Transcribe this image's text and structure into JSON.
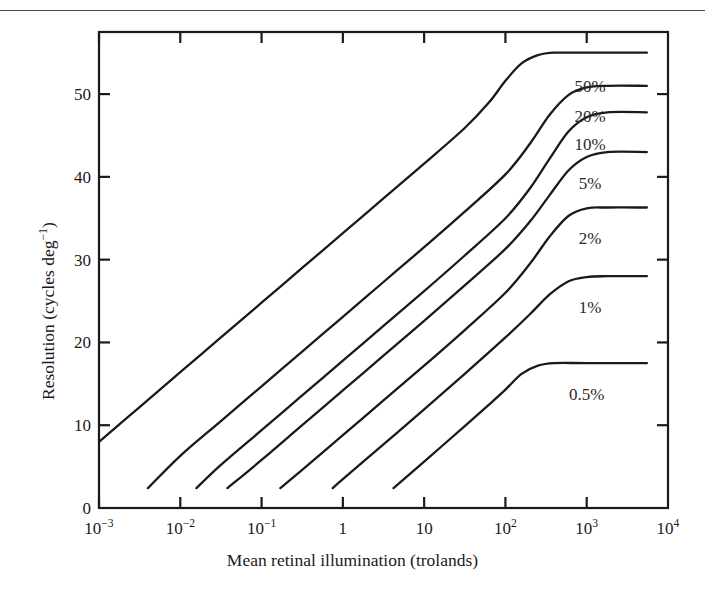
{
  "chart_data": {
    "type": "line",
    "title": "",
    "xlabel": "Mean retinal illumination (trolands)",
    "ylabel": "Resolution (cycles deg⁻¹)",
    "xscale": "log",
    "yscale": "linear",
    "xlim": [
      0.001,
      10000
    ],
    "ylim": [
      0,
      57.5
    ],
    "grid": false,
    "legend_position": "inline-right",
    "xticks": [
      {
        "value": 0.001,
        "label_base": "10",
        "label_exp": "−3",
        "label": "10⁻³"
      },
      {
        "value": 0.01,
        "label_base": "10",
        "label_exp": "−2",
        "label": "10⁻²"
      },
      {
        "value": 0.1,
        "label_base": "10",
        "label_exp": "−1",
        "label": "10⁻¹"
      },
      {
        "value": 1,
        "label_base": "1",
        "label_exp": "",
        "label": "1"
      },
      {
        "value": 10,
        "label_base": "10",
        "label_exp": "",
        "label": "10"
      },
      {
        "value": 100,
        "label_base": "10",
        "label_exp": "2",
        "label": "10²"
      },
      {
        "value": 1000,
        "label_base": "10",
        "label_exp": "3",
        "label": "10³"
      },
      {
        "value": 10000,
        "label_base": "10",
        "label_exp": "4",
        "label": "10⁴"
      }
    ],
    "yticks": [
      {
        "value": 0,
        "label": "0"
      },
      {
        "value": 10,
        "label": "10"
      },
      {
        "value": 20,
        "label": "20"
      },
      {
        "value": 30,
        "label": "30"
      },
      {
        "value": 40,
        "label": "40"
      },
      {
        "value": 50,
        "label": "50"
      }
    ],
    "series": [
      {
        "name": "50%",
        "label": "50%",
        "plateau": 55.0,
        "label_x": 1100,
        "label_y": 51.0,
        "points": [
          {
            "x": 0.001,
            "y": 8.0
          },
          {
            "x": 0.00316,
            "y": 12.2
          },
          {
            "x": 0.01,
            "y": 16.4
          },
          {
            "x": 0.0316,
            "y": 20.6
          },
          {
            "x": 0.1,
            "y": 24.8
          },
          {
            "x": 0.316,
            "y": 29.0
          },
          {
            "x": 1.0,
            "y": 33.2
          },
          {
            "x": 3.16,
            "y": 37.4
          },
          {
            "x": 10.0,
            "y": 41.6
          },
          {
            "x": 31.6,
            "y": 45.9
          },
          {
            "x": 63.0,
            "y": 49.0
          },
          {
            "x": 100.0,
            "y": 51.6
          },
          {
            "x": 158.0,
            "y": 53.7
          },
          {
            "x": 251.0,
            "y": 54.7
          },
          {
            "x": 400.0,
            "y": 55.0
          },
          {
            "x": 1000.0,
            "y": 55.0
          },
          {
            "x": 5500.0,
            "y": 55.0
          }
        ]
      },
      {
        "name": "20%",
        "label": "20%",
        "plateau": 51.0,
        "label_x": 1100,
        "label_y": 47.4,
        "points": [
          {
            "x": 0.004,
            "y": 2.4
          },
          {
            "x": 0.01,
            "y": 6.3
          },
          {
            "x": 0.0316,
            "y": 10.5
          },
          {
            "x": 0.1,
            "y": 14.7
          },
          {
            "x": 0.316,
            "y": 18.9
          },
          {
            "x": 1.0,
            "y": 23.1
          },
          {
            "x": 3.16,
            "y": 27.3
          },
          {
            "x": 10.0,
            "y": 31.5
          },
          {
            "x": 31.6,
            "y": 35.8
          },
          {
            "x": 100.0,
            "y": 40.3
          },
          {
            "x": 200.0,
            "y": 44.0
          },
          {
            "x": 350.0,
            "y": 47.5
          },
          {
            "x": 600.0,
            "y": 49.9
          },
          {
            "x": 1000.0,
            "y": 50.8
          },
          {
            "x": 1800.0,
            "y": 51.0
          },
          {
            "x": 5500.0,
            "y": 51.0
          }
        ]
      },
      {
        "name": "10%",
        "label": "10%",
        "plateau": 47.8,
        "label_x": 1100,
        "label_y": 44.0,
        "points": [
          {
            "x": 0.0158,
            "y": 2.4
          },
          {
            "x": 0.0316,
            "y": 5.2
          },
          {
            "x": 0.1,
            "y": 9.4
          },
          {
            "x": 0.316,
            "y": 13.6
          },
          {
            "x": 1.0,
            "y": 17.8
          },
          {
            "x": 3.16,
            "y": 22.0
          },
          {
            "x": 10.0,
            "y": 26.2
          },
          {
            "x": 31.6,
            "y": 30.5
          },
          {
            "x": 100.0,
            "y": 35.0
          },
          {
            "x": 200.0,
            "y": 38.6
          },
          {
            "x": 350.0,
            "y": 42.2
          },
          {
            "x": 600.0,
            "y": 45.5
          },
          {
            "x": 1000.0,
            "y": 47.2
          },
          {
            "x": 1800.0,
            "y": 47.8
          },
          {
            "x": 5500.0,
            "y": 47.8
          }
        ]
      },
      {
        "name": "5%",
        "label": "5%",
        "plateau": 43.0,
        "label_x": 1100,
        "label_y": 39.3,
        "points": [
          {
            "x": 0.038,
            "y": 2.4
          },
          {
            "x": 0.1,
            "y": 5.8
          },
          {
            "x": 0.316,
            "y": 10.0
          },
          {
            "x": 1.0,
            "y": 14.2
          },
          {
            "x": 3.16,
            "y": 18.4
          },
          {
            "x": 10.0,
            "y": 22.6
          },
          {
            "x": 31.6,
            "y": 26.9
          },
          {
            "x": 100.0,
            "y": 31.3
          },
          {
            "x": 200.0,
            "y": 34.6
          },
          {
            "x": 350.0,
            "y": 37.8
          },
          {
            "x": 600.0,
            "y": 40.8
          },
          {
            "x": 1000.0,
            "y": 42.4
          },
          {
            "x": 1800.0,
            "y": 43.0
          },
          {
            "x": 5500.0,
            "y": 43.0
          }
        ]
      },
      {
        "name": "2%",
        "label": "2%",
        "plateau": 36.3,
        "label_x": 1100,
        "label_y": 32.6,
        "points": [
          {
            "x": 0.17,
            "y": 2.4
          },
          {
            "x": 0.316,
            "y": 4.6
          },
          {
            "x": 1.0,
            "y": 8.8
          },
          {
            "x": 3.16,
            "y": 13.0
          },
          {
            "x": 10.0,
            "y": 17.2
          },
          {
            "x": 31.6,
            "y": 21.5
          },
          {
            "x": 100.0,
            "y": 26.0
          },
          {
            "x": 200.0,
            "y": 29.5
          },
          {
            "x": 350.0,
            "y": 32.8
          },
          {
            "x": 600.0,
            "y": 35.3
          },
          {
            "x": 1000.0,
            "y": 36.2
          },
          {
            "x": 1800.0,
            "y": 36.3
          },
          {
            "x": 5500.0,
            "y": 36.3
          }
        ]
      },
      {
        "name": "1%",
        "label": "1%",
        "plateau": 28.0,
        "label_x": 1100,
        "label_y": 24.3,
        "points": [
          {
            "x": 0.75,
            "y": 2.4
          },
          {
            "x": 1.0,
            "y": 3.5
          },
          {
            "x": 3.16,
            "y": 7.7
          },
          {
            "x": 10.0,
            "y": 11.9
          },
          {
            "x": 31.6,
            "y": 16.2
          },
          {
            "x": 100.0,
            "y": 20.6
          },
          {
            "x": 200.0,
            "y": 23.4
          },
          {
            "x": 350.0,
            "y": 25.8
          },
          {
            "x": 600.0,
            "y": 27.4
          },
          {
            "x": 1000.0,
            "y": 27.9
          },
          {
            "x": 1800.0,
            "y": 28.0
          },
          {
            "x": 5500.0,
            "y": 28.0
          }
        ]
      },
      {
        "name": "0.5%",
        "label": "0.5%",
        "plateau": 17.5,
        "label_x": 1000,
        "label_y": 13.8,
        "points": [
          {
            "x": 4.2,
            "y": 2.4
          },
          {
            "x": 10.0,
            "y": 5.6
          },
          {
            "x": 31.6,
            "y": 9.9
          },
          {
            "x": 63.0,
            "y": 12.5
          },
          {
            "x": 100.0,
            "y": 14.3
          },
          {
            "x": 158.0,
            "y": 16.2
          },
          {
            "x": 251.0,
            "y": 17.2
          },
          {
            "x": 400.0,
            "y": 17.5
          },
          {
            "x": 1000.0,
            "y": 17.5
          },
          {
            "x": 5500.0,
            "y": 17.5
          }
        ]
      }
    ],
    "colors": {
      "curve": "#1a1a1a",
      "axis": "#1a1a1a",
      "background": "#ffffff"
    }
  }
}
